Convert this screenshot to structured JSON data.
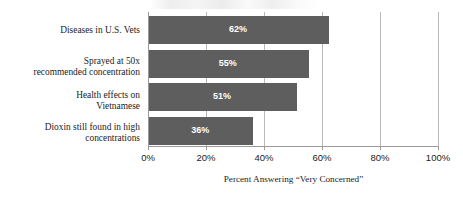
{
  "chart_data": {
    "type": "bar",
    "orientation": "horizontal",
    "title": "",
    "xlabel": "Percent Answering “Very Concerned”",
    "ylabel": "",
    "xlim": [
      0,
      100
    ],
    "grid": true,
    "legend": "none",
    "xunit": "%",
    "categories": [
      "Diseases in U.S. Vets",
      "Sprayed at 50x recommended concentration",
      "Health effects on Vietnamese",
      "Dioxin still found in high concentrations"
    ],
    "category_lines": [
      [
        "Diseases in U.S. Vets"
      ],
      [
        "Sprayed at 50x",
        "recommended concentration"
      ],
      [
        "Health effects on",
        "Vietnamese"
      ],
      [
        "Dioxin still found in high",
        "concentrations"
      ]
    ],
    "values": [
      62,
      55,
      51,
      36
    ],
    "value_labels": [
      "62%",
      "55%",
      "51%",
      "36%"
    ],
    "xticks": [
      0,
      20,
      40,
      60,
      80,
      100
    ],
    "xtick_labels": [
      "0%",
      "20%",
      "40%",
      "60%",
      "80%",
      "100%"
    ],
    "colors": {
      "bar": "#5e5e5e",
      "value_label": "#ffffff",
      "gridline": "#b9b9b9",
      "axis": "#9a9a9a",
      "text": "#1c1c1c",
      "background": "#ffffff"
    }
  }
}
